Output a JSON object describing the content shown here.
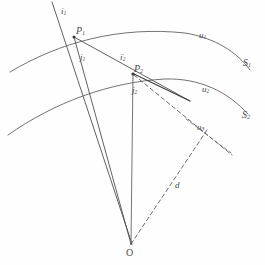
{
  "figure": {
    "background_color": "#fefefe",
    "stroke_color": "#555555",
    "label_color": "#4a4a4a"
  },
  "points": {
    "p1": {
      "label": "P",
      "sub": "1",
      "x": 74,
      "y": 35
    },
    "p2": {
      "label": "P",
      "sub": "2",
      "x": 134,
      "y": 73
    },
    "origin": {
      "label": "O",
      "sub": "",
      "x": 131,
      "y": 245
    }
  },
  "rays": {
    "i1": {
      "label": "i",
      "sub": "1",
      "prime": ""
    },
    "j1": {
      "label": "j",
      "sub": "1",
      "prime": ""
    },
    "i2p": {
      "label": "i",
      "sub": "2",
      "prime": "'"
    },
    "j2": {
      "label": "j",
      "sub": "2",
      "prime": ""
    }
  },
  "surfaces": {
    "s1": {
      "label": "S",
      "sub": "1"
    },
    "s2": {
      "label": "S",
      "sub": "2"
    }
  },
  "vectors": {
    "u1": {
      "label": "u",
      "sub": "1"
    },
    "u2": {
      "label": "u",
      "sub": "2"
    },
    "u3": {
      "label": "u",
      "sub": "3"
    }
  },
  "distance": {
    "label": "d",
    "sub": ""
  },
  "label_positions": {
    "i1": {
      "x": 61,
      "y": 7
    },
    "j1": {
      "x": 80,
      "y": 55
    },
    "i2p": {
      "x": 120,
      "y": 55
    },
    "j2": {
      "x": 132,
      "y": 88
    },
    "p1": {
      "x": 76,
      "y": 28
    },
    "p2": {
      "x": 132,
      "y": 68
    },
    "s1": {
      "x": 245,
      "y": 63
    },
    "s2": {
      "x": 244,
      "y": 115
    },
    "u1": {
      "x": 200,
      "y": 34
    },
    "u2": {
      "x": 203,
      "y": 88
    },
    "u3": {
      "x": 199,
      "y": 126
    },
    "d": {
      "x": 176,
      "y": 184
    },
    "o": {
      "x": 127,
      "y": 244
    }
  },
  "geometry": {
    "arc_s1": "M 10,72 C 60,42 120,26 185,33 C 215,38 237,52 250,70",
    "arc_s2": "M 8,135 C 55,102 110,82 165,79 C 200,78 228,92 248,114",
    "ray_incident_p1": "M 52,2 L 132,244",
    "ray_p1_to_p2_o": "M 74,37 L 131,244",
    "ray_p2_vertical": "M 133,73 L 131,244",
    "ray_p2_short": "M 134,74 L 190,101",
    "dashed_p2": "M 134,75 L 232,155",
    "dashed_o_u3": "M 131,244 L 207,130",
    "chord_u3": "M 186,119 L 231,153"
  }
}
